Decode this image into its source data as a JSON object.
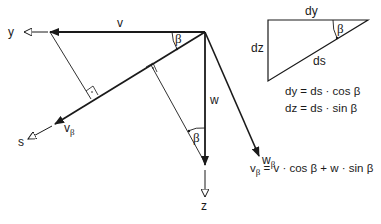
{
  "colors": {
    "stroke": "#1a1a1a",
    "background": "#ffffff"
  },
  "labels": {
    "axis_y": "y",
    "axis_s": "s",
    "axis_z": "z",
    "v": "v",
    "w": "w",
    "v_beta_main": "v",
    "v_beta_sub": "β",
    "w_beta_main": "w",
    "w_beta_sub": "β",
    "beta_top": "β",
    "beta_lower": "β"
  },
  "triangle": {
    "top_label": "dy",
    "left_label": "dz",
    "hyp_label": "ds",
    "angle_label": "β"
  },
  "equations": {
    "eq1": "dy = ds · cos β",
    "eq2": "dz = ds · sin β",
    "eq3_main_v": "v",
    "eq3_sub": "β",
    "eq3_rest": " = v · cos β + w · sin β"
  }
}
